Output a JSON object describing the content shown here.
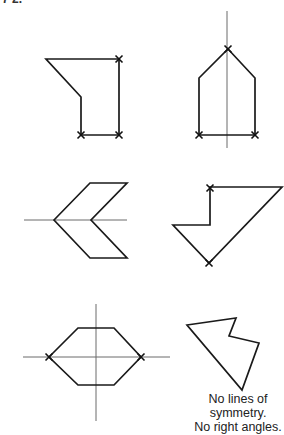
{
  "question_label_fragment": "7 2.",
  "colors": {
    "stroke": "#1a1a1a",
    "axis": "#6a6a6a",
    "background": "#ffffff"
  },
  "shapes": [
    {
      "id": "shape-1",
      "description": "irregular pentagon with two right angles marked",
      "points": [
        [
          46,
          59
        ],
        [
          119,
          59
        ],
        [
          119,
          135
        ],
        [
          81,
          135
        ],
        [
          81,
          97
        ]
      ],
      "right_angle_marks": [
        [
          119,
          59
        ],
        [
          81,
          135
        ],
        [
          119,
          135
        ]
      ],
      "symmetry_lines": []
    },
    {
      "id": "shape-2",
      "description": "house-shaped pentagon with vertical line of symmetry",
      "points": [
        [
          228,
          49
        ],
        [
          255,
          78
        ],
        [
          255,
          135
        ],
        [
          199,
          135
        ],
        [
          199,
          78
        ]
      ],
      "right_angle_marks": [
        [
          228,
          49
        ],
        [
          199,
          135
        ],
        [
          255,
          135
        ]
      ],
      "symmetry_lines": [
        [
          [
            227,
            11
          ],
          [
            227,
            148
          ]
        ]
      ]
    },
    {
      "id": "shape-3",
      "description": "chevron hexagon with horizontal line of symmetry",
      "points": [
        [
          54,
          220
        ],
        [
          90,
          183
        ],
        [
          127,
          183
        ],
        [
          91,
          220
        ],
        [
          127,
          258
        ],
        [
          90,
          258
        ]
      ],
      "right_angle_marks": [],
      "symmetry_lines": [
        [
          [
            24,
            220
          ],
          [
            127,
            220
          ]
        ]
      ]
    },
    {
      "id": "shape-4",
      "description": "irregular pentagon with right angles marked",
      "points": [
        [
          210,
          187
        ],
        [
          282,
          187
        ],
        [
          209,
          263
        ],
        [
          173,
          225
        ],
        [
          210,
          225
        ]
      ],
      "right_angle_marks": [
        [
          210,
          188
        ],
        [
          209,
          263
        ]
      ],
      "symmetry_lines": []
    },
    {
      "id": "shape-5",
      "description": "hexagon with two lines of symmetry",
      "points": [
        [
          49,
          357
        ],
        [
          78,
          328
        ],
        [
          114,
          328
        ],
        [
          141,
          357
        ],
        [
          114,
          385
        ],
        [
          78,
          385
        ]
      ],
      "right_angle_marks": [
        [
          49,
          357
        ],
        [
          141,
          357
        ]
      ],
      "symmetry_lines": [
        [
          [
            23,
            357
          ],
          [
            170,
            357
          ]
        ],
        [
          [
            96,
            304
          ],
          [
            96,
            421
          ]
        ]
      ]
    },
    {
      "id": "shape-6",
      "description": "irregular pentagon with no symmetry and no right angles",
      "points": [
        [
          187,
          325
        ],
        [
          236,
          318
        ],
        [
          229,
          336
        ],
        [
          259,
          343
        ],
        [
          242,
          390
        ]
      ],
      "right_angle_marks": [],
      "symmetry_lines": []
    }
  ],
  "caption": {
    "line1": "No lines of",
    "line2": "symmetry.",
    "line3": "No right angles."
  }
}
